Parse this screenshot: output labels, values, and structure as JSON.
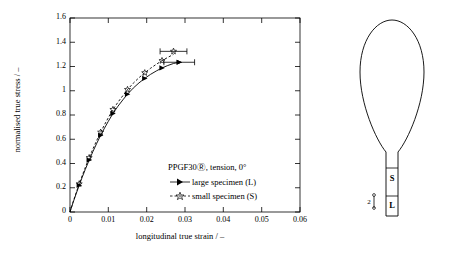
{
  "chart_data": {
    "type": "line",
    "title": "",
    "xlabel": "longitudinal true strain / –",
    "ylabel": "normalised true stress / –",
    "xlim": [
      0,
      0.06
    ],
    "ylim": [
      0,
      1.6
    ],
    "xticks": [
      "0",
      "0.01",
      "0.02",
      "0.03",
      "0.04",
      "0.05",
      "0.06"
    ],
    "yticks": [
      "0",
      "0.2",
      "0.4",
      "0.6",
      "0.8",
      "1",
      "1.2",
      "1.4",
      "1.6"
    ],
    "grid": false,
    "legend_position": "inside-lower-right",
    "legend_title": "PPGF30Ⓡ, tension, 0°",
    "series": [
      {
        "name": "large specimen (L)",
        "marker": "filled-triangle-right",
        "linestyle": "solid",
        "x": [
          0.0,
          0.0008,
          0.0016,
          0.0024,
          0.0032,
          0.004,
          0.005,
          0.006,
          0.007,
          0.008,
          0.009,
          0.01,
          0.0112,
          0.0125,
          0.0138,
          0.015,
          0.0165,
          0.018,
          0.0195,
          0.021,
          0.0225,
          0.024,
          0.0255,
          0.027,
          0.0285
        ],
        "y": [
          0.0,
          0.078,
          0.15,
          0.22,
          0.288,
          0.352,
          0.428,
          0.5,
          0.568,
          0.632,
          0.692,
          0.748,
          0.812,
          0.872,
          0.925,
          0.972,
          1.022,
          1.065,
          1.102,
          1.135,
          1.163,
          1.188,
          1.208,
          1.225,
          1.235
        ],
        "endpoint_error_bar": {
          "x": 0.0285,
          "y": 1.235,
          "xerr": 0.004
        }
      },
      {
        "name": "small specimen (S)",
        "marker": "open-star",
        "linestyle": "dashed",
        "x": [
          0.0,
          0.0008,
          0.0016,
          0.0024,
          0.0032,
          0.004,
          0.005,
          0.006,
          0.007,
          0.008,
          0.009,
          0.01,
          0.0112,
          0.0125,
          0.0138,
          0.015,
          0.0165,
          0.018,
          0.0195,
          0.021,
          0.0225,
          0.024,
          0.0255,
          0.027
        ],
        "y": [
          0.0,
          0.082,
          0.158,
          0.232,
          0.302,
          0.368,
          0.448,
          0.522,
          0.592,
          0.658,
          0.72,
          0.778,
          0.845,
          0.905,
          0.96,
          1.01,
          1.062,
          1.108,
          1.148,
          1.185,
          1.218,
          1.248,
          1.275,
          1.3
        ],
        "endpoint_error_bar": {
          "x": 0.027,
          "y": 1.325,
          "xerr": 0.0035
        }
      }
    ]
  },
  "specimen_diagram": {
    "large_label": "L",
    "small_label": "S",
    "scale_marker": "2",
    "scale_unit": ""
  }
}
